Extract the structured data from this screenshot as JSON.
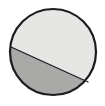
{
  "figure": {
    "name": "shaded-circle-diagram",
    "type": "partitioned-circle",
    "canvas": {
      "width": 105,
      "height": 106,
      "background_color": "#ffffff"
    },
    "circle": {
      "center_x": 53,
      "center_y": 52,
      "radius": 43,
      "outline_color": "#1c1c1c",
      "outline_width": 2.2
    },
    "chord": {
      "start_x": 11,
      "start_y": 47,
      "end_x": 88,
      "end_y": 82,
      "color": "#1c1c1c",
      "width": 1.3,
      "slope": 0.45,
      "angle_degrees": 24.5
    },
    "regions": [
      {
        "name": "upper-right-region",
        "label": "",
        "fill_color": "#e6e6e4",
        "position": "above-chord",
        "relative_area": "larger"
      },
      {
        "name": "lower-left-region",
        "label": "",
        "fill_color": "#a9a9a7",
        "position": "below-chord",
        "relative_area": "smaller"
      }
    ]
  }
}
